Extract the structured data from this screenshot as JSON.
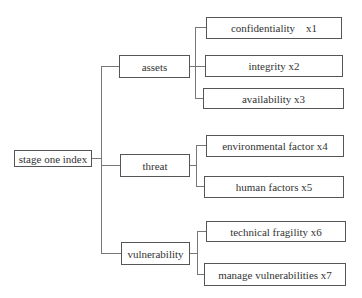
{
  "diagram": {
    "root": {
      "label": "stage one index"
    },
    "categories": [
      {
        "label": "assets",
        "children": [
          {
            "label": "confidentiality    x1"
          },
          {
            "label": "integrity x2"
          },
          {
            "label": "availability x3"
          }
        ]
      },
      {
        "label": "threat",
        "children": [
          {
            "label": "environmental factor x4"
          },
          {
            "label": "human factors x5"
          }
        ]
      },
      {
        "label": "vulnerability",
        "children": [
          {
            "label": "technical fragility x6"
          },
          {
            "label": "manage vulnerabilities x7"
          }
        ]
      }
    ]
  }
}
